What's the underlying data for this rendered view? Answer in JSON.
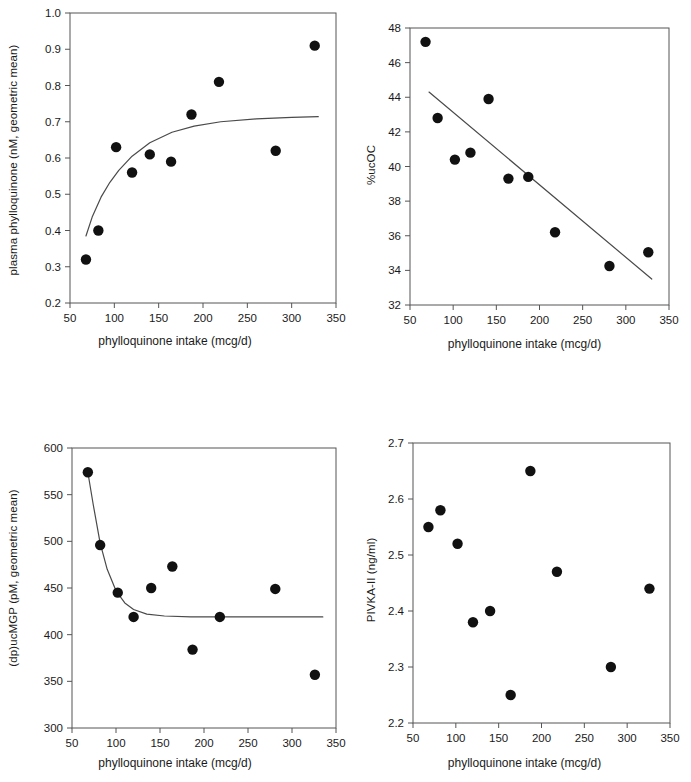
{
  "figure": {
    "panel_count": 4,
    "background": "#ffffff",
    "marker_color": "#111111",
    "line_color": "#4a4a4a",
    "axis_color": "#555555"
  },
  "chart_data": [
    {
      "id": "panel-a",
      "type": "scatter",
      "title": "",
      "xlabel": "phylloquinone intake (mcg/d)",
      "ylabel": "plasma phylloquinone (nM, geometric mean)",
      "xlim": [
        50,
        350
      ],
      "ylim": [
        0.2,
        1.0
      ],
      "xticks": [
        50,
        100,
        150,
        200,
        250,
        300,
        350
      ],
      "yticks": [
        "0.2",
        "0.3",
        "0.4",
        "0.5",
        "0.6",
        "0.7",
        "0.8",
        "0.9",
        "1.0"
      ],
      "grid": false,
      "legend": "none",
      "points": [
        {
          "x": 68,
          "y": 0.32
        },
        {
          "x": 82,
          "y": 0.4
        },
        {
          "x": 102,
          "y": 0.63
        },
        {
          "x": 120,
          "y": 0.56
        },
        {
          "x": 140,
          "y": 0.61
        },
        {
          "x": 164,
          "y": 0.59
        },
        {
          "x": 187,
          "y": 0.72
        },
        {
          "x": 218,
          "y": 0.81
        },
        {
          "x": 282,
          "y": 0.62
        },
        {
          "x": 326,
          "y": 0.91
        }
      ],
      "fit_curve": {
        "shape": "rising saturating",
        "points": [
          {
            "x": 68,
            "y": 0.385
          },
          {
            "x": 75,
            "y": 0.437
          },
          {
            "x": 85,
            "y": 0.492
          },
          {
            "x": 95,
            "y": 0.533
          },
          {
            "x": 105,
            "y": 0.566
          },
          {
            "x": 120,
            "y": 0.605
          },
          {
            "x": 140,
            "y": 0.642
          },
          {
            "x": 165,
            "y": 0.671
          },
          {
            "x": 190,
            "y": 0.688
          },
          {
            "x": 220,
            "y": 0.7
          },
          {
            "x": 260,
            "y": 0.708
          },
          {
            "x": 300,
            "y": 0.712
          },
          {
            "x": 330,
            "y": 0.714
          }
        ]
      }
    },
    {
      "id": "panel-b",
      "type": "scatter",
      "title": "",
      "xlabel": "phylloquinone intake (mcg/d)",
      "ylabel": "%ucOC",
      "xlim": [
        50,
        350
      ],
      "ylim": [
        32,
        48
      ],
      "xticks": [
        50,
        100,
        150,
        200,
        250,
        300,
        350
      ],
      "yticks": [
        "32",
        "34",
        "36",
        "38",
        "40",
        "42",
        "44",
        "46",
        "48"
      ],
      "grid": false,
      "legend": "none",
      "points": [
        {
          "x": 68,
          "y": 47.2
        },
        {
          "x": 82,
          "y": 42.8
        },
        {
          "x": 102,
          "y": 40.4
        },
        {
          "x": 120,
          "y": 40.8
        },
        {
          "x": 141,
          "y": 43.9
        },
        {
          "x": 164,
          "y": 39.3
        },
        {
          "x": 187,
          "y": 39.4
        },
        {
          "x": 218,
          "y": 36.2
        },
        {
          "x": 281,
          "y": 34.25
        },
        {
          "x": 326,
          "y": 35.05
        }
      ],
      "fit_curve": {
        "shape": "linear decreasing",
        "points": [
          {
            "x": 72,
            "y": 44.3
          },
          {
            "x": 330,
            "y": 33.5
          }
        ]
      }
    },
    {
      "id": "panel-c",
      "type": "scatter",
      "title": "",
      "xlabel": "phylloquinone intake (mcg/d)",
      "ylabel": "(dp)ucMGP (pM, geometric mean)",
      "xlim": [
        50,
        350
      ],
      "ylim": [
        300,
        600
      ],
      "xticks": [
        50,
        100,
        150,
        200,
        250,
        300,
        350
      ],
      "yticks": [
        "300",
        "350",
        "400",
        "450",
        "500",
        "550",
        "600"
      ],
      "grid": false,
      "legend": "none",
      "points": [
        {
          "x": 68,
          "y": 574
        },
        {
          "x": 82,
          "y": 496
        },
        {
          "x": 102,
          "y": 445
        },
        {
          "x": 120,
          "y": 419
        },
        {
          "x": 140,
          "y": 450
        },
        {
          "x": 164,
          "y": 473
        },
        {
          "x": 187,
          "y": 384
        },
        {
          "x": 218,
          "y": 419
        },
        {
          "x": 281,
          "y": 449
        },
        {
          "x": 326,
          "y": 357
        }
      ],
      "fit_curve": {
        "shape": "decaying to plateau",
        "points": [
          {
            "x": 68,
            "y": 574
          },
          {
            "x": 74,
            "y": 540
          },
          {
            "x": 82,
            "y": 498
          },
          {
            "x": 90,
            "y": 470
          },
          {
            "x": 100,
            "y": 447
          },
          {
            "x": 110,
            "y": 434
          },
          {
            "x": 120,
            "y": 427
          },
          {
            "x": 135,
            "y": 422
          },
          {
            "x": 155,
            "y": 420
          },
          {
            "x": 185,
            "y": 419
          },
          {
            "x": 220,
            "y": 419
          },
          {
            "x": 280,
            "y": 419
          },
          {
            "x": 335,
            "y": 419
          }
        ]
      }
    },
    {
      "id": "panel-d",
      "type": "scatter",
      "title": "",
      "xlabel": "phylloquinone intake (mcg/d)",
      "ylabel": "PIVKA-II (ng/ml)",
      "xlim": [
        50,
        350
      ],
      "ylim": [
        2.2,
        2.7
      ],
      "xticks": [
        50,
        100,
        150,
        200,
        250,
        300,
        350
      ],
      "yticks": [
        "2.2",
        "2.3",
        "2.4",
        "2.5",
        "2.6",
        "2.7"
      ],
      "grid": false,
      "legend": "none",
      "points": [
        {
          "x": 68,
          "y": 2.55
        },
        {
          "x": 82,
          "y": 2.58
        },
        {
          "x": 102,
          "y": 2.52
        },
        {
          "x": 120,
          "y": 2.38
        },
        {
          "x": 140,
          "y": 2.4
        },
        {
          "x": 164,
          "y": 2.25
        },
        {
          "x": 187,
          "y": 2.65
        },
        {
          "x": 218,
          "y": 2.47
        },
        {
          "x": 281,
          "y": 2.3
        },
        {
          "x": 326,
          "y": 2.44
        }
      ],
      "fit_curve": null
    }
  ]
}
